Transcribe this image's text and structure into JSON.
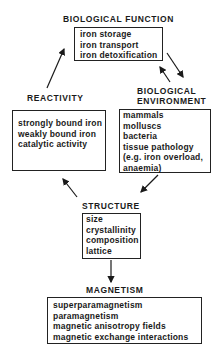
{
  "nodes": {
    "biological_function": {
      "title": "BIOLOGICAL FUNCTION",
      "items": [
        "iron storage",
        "iron transport",
        "iron detoxification"
      ]
    },
    "reactivity": {
      "title": "REACTIVITY",
      "items": [
        "strongly bound iron",
        "weakly bound iron",
        "catalytic activity"
      ]
    },
    "biological_environment": {
      "title_line1": "BIOLOGICAL",
      "title_line2": "ENVIRONMENT",
      "items": [
        "mammals",
        "molluscs",
        "bacteria",
        "tissue pathology",
        "(e.g. iron overload,",
        "anaemia)"
      ]
    },
    "structure": {
      "title": "STRUCTURE",
      "items": [
        "size",
        "crystallinity",
        "composition",
        "lattice"
      ]
    },
    "magnetism": {
      "title": "MAGNETISM",
      "items": [
        "superparamagnetism",
        "paramagnetism",
        "magnetic anisotropy fields",
        "magnetic exchange interactions"
      ]
    }
  },
  "edges": [
    {
      "from": "reactivity",
      "to": "biological_function"
    },
    {
      "from": "biological_function",
      "to": "biological_environment"
    },
    {
      "from": "biological_environment",
      "to": "biological_function"
    },
    {
      "from": "biological_environment",
      "to": "structure"
    },
    {
      "from": "structure",
      "to": "reactivity"
    },
    {
      "from": "structure",
      "to": "magnetism"
    }
  ]
}
